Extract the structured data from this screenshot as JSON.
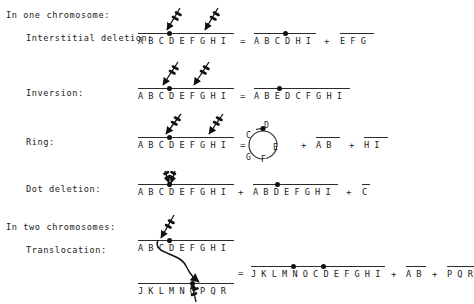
{
  "diagram": {
    "background": "#ffffff",
    "ink": "#222222"
  },
  "sections": [
    {
      "id": "one",
      "label": "In one chromosome:"
    },
    {
      "id": "two",
      "label": "In two chromosomes:"
    }
  ],
  "rows": [
    {
      "id": "interstitial-deletion",
      "label": "Interstitial deletion:",
      "source": {
        "letters": "A B C D E F G H I",
        "centromere_after": "C"
      },
      "equals": "=",
      "results": [
        {
          "letters": "A B C D H I",
          "centromere_after": "C"
        },
        {
          "letters": "E F G",
          "centromere_after": null
        }
      ],
      "plus": "+",
      "breaks": 2
    },
    {
      "id": "inversion",
      "label": "Inversion:",
      "source": {
        "letters": "A B C D E F G H I",
        "centromere_after": "C"
      },
      "equals": "=",
      "results": [
        {
          "letters": "A B E D C F G H I",
          "centromere_after": "B"
        }
      ],
      "plus": "",
      "breaks": 2
    },
    {
      "id": "ring",
      "label": "Ring:",
      "source": {
        "letters": "A B C D E F G H I",
        "centromere_after": "C"
      },
      "equals": "=",
      "ring": {
        "letters": [
          "C",
          "D",
          "E",
          "F",
          "G"
        ],
        "centromere_between": "C-D"
      },
      "results": [
        {
          "letters": "A B",
          "centromere_after": null
        },
        {
          "letters": "H I",
          "centromere_after": null
        }
      ],
      "plus": "+",
      "breaks": 2
    },
    {
      "id": "dot-deletion",
      "label": "Dot deletion:",
      "source": {
        "letters": "A B C D E F G H I",
        "centromere_after": "C"
      },
      "equals": "+",
      "results": [
        {
          "letters": "A B D E F G H I",
          "centromere_after": "B"
        },
        {
          "letters": "C",
          "centromere_after": null
        }
      ],
      "plus": "+",
      "breaks": 2
    },
    {
      "id": "translocation",
      "label": "Translocation:",
      "source": {
        "letters": "A B C D E F G H I",
        "centromere_after": "C"
      },
      "source2": {
        "letters": "J K L M N O P Q R",
        "centromere_after": "N"
      },
      "equals": "=",
      "results": [
        {
          "letters": "J K L M N O C D E F G H I",
          "centromere_after_1": "M",
          "centromere_after_2": "O"
        },
        {
          "letters": "A B",
          "centromere_after": null
        },
        {
          "letters": "P Q R",
          "centromere_after": null
        }
      ],
      "plus": "+",
      "breaks": 2
    }
  ],
  "symbols": {
    "equals": "=",
    "plus": "+",
    "centromere": "centromere-dot",
    "break": "break-arrow"
  }
}
